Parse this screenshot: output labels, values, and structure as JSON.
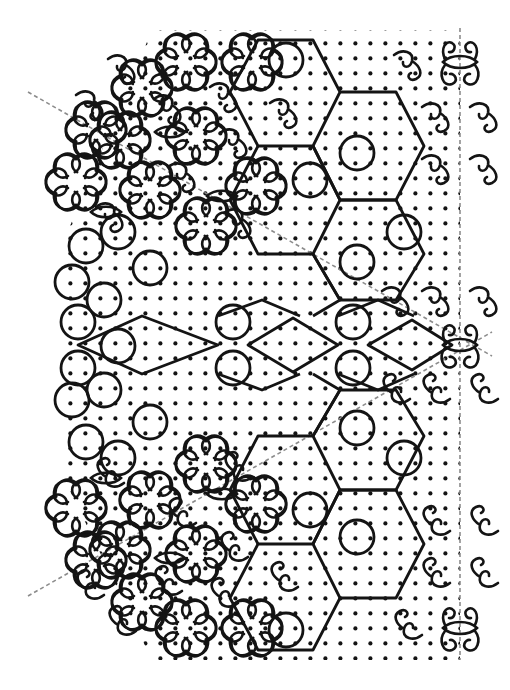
{
  "figure": {
    "title": "Kolam dot-grid line drawing",
    "kind": "line-drawing",
    "width": 510,
    "height": 690,
    "background_color": "#ffffff",
    "ink_color": "#141414",
    "axis_color": "#8c8c8c"
  },
  "dot_grid": {
    "name": "pulli-dot-lattice",
    "spacing_x": 15,
    "spacing_y": 15,
    "dot_radius": 2.1,
    "dot_color": "#141414",
    "origin_x": 67,
    "origin_y": 40,
    "columns": 27,
    "rows": 41,
    "shape": "hexagon-tapered-left",
    "description": "Square lattice of pulli dots clipped to a blunt arrow / tapered-hexagon silhouette that is widest at the vertical right edge and narrows toward the upper-left and lower-left."
  },
  "symmetry_axes": [
    {
      "name": "vertical-mirror-axis",
      "style": "dashed",
      "color": "#8c8c8c",
      "x1": 460,
      "y1": 28,
      "x2": 460,
      "y2": 660
    },
    {
      "name": "diagonal-axis-upper-left",
      "style": "dashed",
      "color": "#8c8c8c",
      "x1": 28,
      "y1": 92,
      "x2": 492,
      "y2": 356
    },
    {
      "name": "diagonal-axis-lower-left",
      "style": "dashed",
      "color": "#8c8c8c",
      "x1": 28,
      "y1": 596,
      "x2": 492,
      "y2": 332
    }
  ],
  "motifs": [
    {
      "name": "rosette-flower",
      "label": "Six-petal curled rosette",
      "region": "upper-left and lower-left borders",
      "count": 14,
      "petal_count": 6,
      "radius": 24
    },
    {
      "name": "scalloped-circle",
      "label": "Plain scalloped circle enclosing four dots",
      "region": "left edge midband and interior chain",
      "count": 22,
      "radius": 17
    },
    {
      "name": "vesica-eye",
      "label": "Pointed oval 'eye' with a single centre dot",
      "region": "interior and right axis",
      "count": 9,
      "width": 30,
      "height": 13
    },
    {
      "name": "s-curl",
      "label": "Interlocking S-shaped curl linking adjacent rosettes",
      "region": "tapered left flanks",
      "count": 30
    },
    {
      "name": "diamond-circle-chain",
      "label": "Horizontal chain of diamonds alternating with circles",
      "region": "central horizontal band",
      "count": 7
    },
    {
      "name": "hexagon-lattice-path",
      "label": "Large zig-zag hexagon outline threading through circles",
      "region": "right half, upper and lower quadrants",
      "count": 4
    },
    {
      "name": "horned-eye-finial",
      "label": "Eye motif flanked by two upward horns on the mirror axis",
      "region": "right edge, top / middle / bottom",
      "count": 3
    }
  ],
  "legend": {
    "visible": false,
    "items": []
  },
  "caption": {
    "visible": false,
    "text": ""
  }
}
